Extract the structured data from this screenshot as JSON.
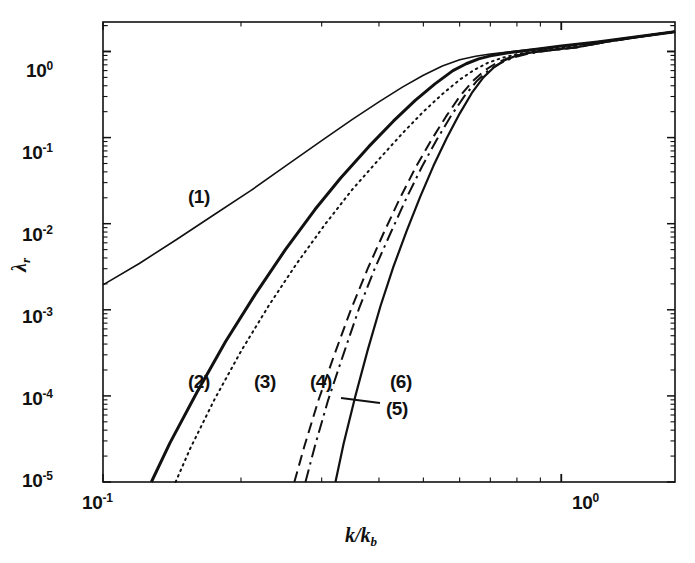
{
  "figure": {
    "background": "#ffffff",
    "ink_color": "#111111"
  },
  "axes": {
    "x_title": "k/k",
    "x_title_sub": "b",
    "y_title": "λ",
    "y_title_sub": "r",
    "x_ticks": [
      {
        "value": 0.1,
        "mantissa": "10",
        "exponent": "-1"
      },
      {
        "value": 1.0,
        "mantissa": "10",
        "exponent": "0"
      }
    ],
    "y_ticks": [
      {
        "value": 1.0,
        "mantissa": "10",
        "exponent": "0"
      },
      {
        "value": 0.1,
        "mantissa": "10",
        "exponent": "-1"
      },
      {
        "value": 0.01,
        "mantissa": "10",
        "exponent": "-2"
      },
      {
        "value": 0.001,
        "mantissa": "10",
        "exponent": "-3"
      },
      {
        "value": 0.0001,
        "mantissa": "10",
        "exponent": "-4"
      },
      {
        "value": 1e-05,
        "mantissa": "10",
        "exponent": "-5"
      }
    ]
  },
  "curve_labels": [
    {
      "id": "1",
      "text": "(1)",
      "x": 188,
      "y": 186
    },
    {
      "id": "2",
      "text": "(2)",
      "x": 188,
      "y": 371
    },
    {
      "id": "3",
      "text": "(3)",
      "x": 254,
      "y": 371
    },
    {
      "id": "4",
      "text": "(4)",
      "x": 310,
      "y": 371
    },
    {
      "id": "5",
      "text": "(5)",
      "x": 386,
      "y": 398
    },
    {
      "id": "6",
      "text": "(6)",
      "x": 390,
      "y": 371
    }
  ],
  "chart_data": {
    "type": "line",
    "title": "",
    "xlabel": "k/k_b",
    "ylabel": "lambda_r",
    "xscale": "log",
    "yscale": "log",
    "xlim": [
      0.1,
      1.77
    ],
    "ylim": [
      1e-05,
      2.2
    ],
    "grid": false,
    "legend": "inline-annotations",
    "x_tick_values": [
      0.1,
      1.0
    ],
    "y_tick_values": [
      1e-05,
      0.0001,
      0.001,
      0.01,
      0.1,
      1.0
    ],
    "series": [
      {
        "name": "(1)",
        "style": "solid",
        "width": 1.6,
        "x": [
          0.1,
          0.12,
          0.145,
          0.175,
          0.21,
          0.25,
          0.3,
          0.35,
          0.4,
          0.45,
          0.5,
          0.55,
          0.6,
          0.65,
          0.7,
          0.8,
          0.9,
          1.0,
          1.2,
          1.45,
          1.77
        ],
        "y": [
          0.00195,
          0.00345,
          0.0066,
          0.0128,
          0.0242,
          0.0465,
          0.092,
          0.163,
          0.26,
          0.385,
          0.53,
          0.68,
          0.8,
          0.88,
          0.935,
          1.01,
          1.085,
          1.16,
          1.29,
          1.47,
          1.7
        ]
      },
      {
        "name": "(2)",
        "style": "solid",
        "width": 3.0,
        "x": [
          0.1275,
          0.14,
          0.16,
          0.185,
          0.215,
          0.25,
          0.29,
          0.33,
          0.38,
          0.43,
          0.48,
          0.53,
          0.58,
          0.62,
          0.66,
          0.7,
          0.76,
          0.83,
          0.9,
          1.0,
          1.2,
          1.45,
          1.77
        ],
        "y": [
          1e-05,
          2.85e-05,
          0.000108,
          0.000425,
          0.00152,
          0.005,
          0.0146,
          0.034,
          0.0785,
          0.155,
          0.27,
          0.42,
          0.6,
          0.72,
          0.82,
          0.89,
          0.96,
          1.02,
          1.075,
          1.155,
          1.29,
          1.47,
          1.7
        ]
      },
      {
        "name": "(3)",
        "style": "dotted",
        "width": 2.0,
        "x": [
          0.144,
          0.155,
          0.175,
          0.2,
          0.23,
          0.265,
          0.305,
          0.35,
          0.4,
          0.45,
          0.5,
          0.55,
          0.6,
          0.645,
          0.69,
          0.74,
          0.8,
          0.87,
          0.94,
          1.02,
          1.2,
          1.45,
          1.77
        ],
        "y": [
          1e-05,
          2.45e-05,
          9.05e-05,
          0.00033,
          0.00112,
          0.00348,
          0.0098,
          0.025,
          0.056,
          0.112,
          0.2,
          0.32,
          0.47,
          0.61,
          0.735,
          0.84,
          0.93,
          1.005,
          1.06,
          1.12,
          1.29,
          1.47,
          1.7
        ]
      },
      {
        "name": "(4)",
        "style": "dashed",
        "width": 2.0,
        "x": [
          0.2615,
          0.275,
          0.295,
          0.32,
          0.348,
          0.378,
          0.41,
          0.445,
          0.482,
          0.52,
          0.56,
          0.6,
          0.64,
          0.68,
          0.72,
          0.77,
          0.83,
          0.9,
          0.98,
          1.08,
          1.25,
          1.48,
          1.77
        ],
        "y": [
          1e-05,
          2.6e-05,
          8.85e-05,
          0.000305,
          0.00103,
          0.003,
          0.0079,
          0.02,
          0.046,
          0.093,
          0.175,
          0.3,
          0.45,
          0.6,
          0.73,
          0.85,
          0.94,
          1.005,
          1.055,
          1.12,
          1.3,
          1.49,
          1.7
        ]
      },
      {
        "name": "(5)",
        "style": "dashdot",
        "width": 2.0,
        "x": [
          0.2765,
          0.29,
          0.31,
          0.335,
          0.362,
          0.392,
          0.425,
          0.46,
          0.497,
          0.535,
          0.575,
          0.615,
          0.655,
          0.695,
          0.738,
          0.788,
          0.845,
          0.915,
          0.99,
          1.09,
          1.26,
          1.49,
          1.77
        ],
        "y": [
          1e-05,
          2.62e-05,
          9e-05,
          0.00031,
          0.00104,
          0.00305,
          0.008,
          0.0202,
          0.0465,
          0.095,
          0.18,
          0.305,
          0.458,
          0.608,
          0.738,
          0.855,
          0.942,
          1.008,
          1.058,
          1.122,
          1.3,
          1.49,
          1.7
        ]
      },
      {
        "name": "(6)",
        "style": "solid",
        "width": 2.2,
        "x": [
          0.3215,
          0.335,
          0.355,
          0.378,
          0.403,
          0.43,
          0.46,
          0.492,
          0.526,
          0.562,
          0.6,
          0.638,
          0.676,
          0.714,
          0.752,
          0.796,
          0.85,
          0.915,
          0.99,
          1.09,
          1.26,
          1.49,
          1.77
        ],
        "y": [
          1e-05,
          2.8e-05,
          9.8e-05,
          0.00034,
          0.0011,
          0.00315,
          0.0083,
          0.0205,
          0.047,
          0.098,
          0.19,
          0.33,
          0.5,
          0.66,
          0.79,
          0.89,
          0.965,
          1.02,
          1.065,
          1.128,
          1.3,
          1.49,
          1.7
        ]
      }
    ],
    "annotations": [
      {
        "label": "(5)",
        "leader_from": [
          380,
          403
        ],
        "leader_to": [
          341,
          398
        ]
      }
    ]
  }
}
